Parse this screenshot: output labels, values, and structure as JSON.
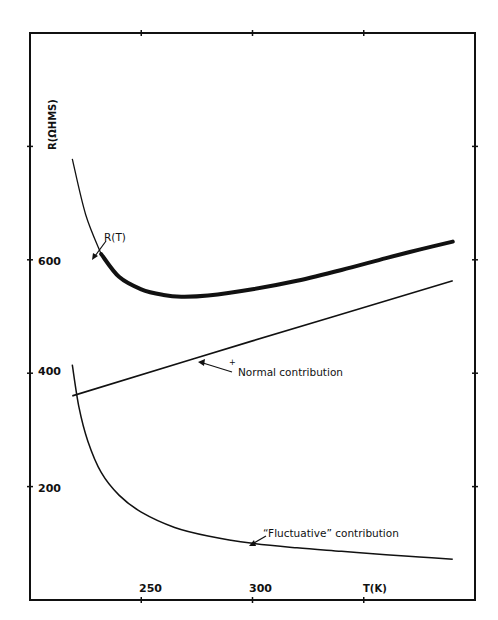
{
  "chart_data": {
    "type": "line",
    "title": "",
    "xlabel": "T(K)",
    "ylabel": "R(ΩHMS)",
    "xlim": [
      200,
      400
    ],
    "ylim": [
      0,
      1000
    ],
    "x_ticks": [
      200,
      250,
      300,
      350,
      400
    ],
    "x_tick_labels": [
      "",
      "250",
      "300",
      "",
      ""
    ],
    "y_ticks": [
      0,
      200,
      400,
      600,
      800,
      1000
    ],
    "y_tick_labels": [
      "",
      "200",
      "400",
      "600",
      "",
      ""
    ],
    "grid": false,
    "legend": "none (curves annotated with arrows)",
    "series": [
      {
        "name": "R(T)",
        "style": "thick line (data band) with thin extension at low T",
        "points": [
          [
            219,
            778
          ],
          [
            225,
            680
          ],
          [
            232,
            610
          ],
          [
            240,
            570
          ],
          [
            250,
            548
          ],
          [
            260,
            538
          ],
          [
            268,
            535
          ],
          [
            280,
            537
          ],
          [
            300,
            548
          ],
          [
            320,
            563
          ],
          [
            340,
            582
          ],
          [
            360,
            603
          ],
          [
            375,
            618
          ],
          [
            390,
            632
          ]
        ]
      },
      {
        "name": "Normal contribution",
        "style": "thin straight line",
        "points": [
          [
            219,
            360
          ],
          [
            300,
            457
          ],
          [
            390,
            563
          ]
        ]
      },
      {
        "name": "\"Fluctuative\" contribution",
        "style": "thin line",
        "points": [
          [
            219,
            415
          ],
          [
            222,
            340
          ],
          [
            226,
            280
          ],
          [
            232,
            225
          ],
          [
            240,
            185
          ],
          [
            250,
            155
          ],
          [
            265,
            128
          ],
          [
            280,
            113
          ],
          [
            300,
            100
          ],
          [
            320,
            92
          ],
          [
            340,
            86
          ],
          [
            360,
            80
          ],
          [
            375,
            76
          ],
          [
            390,
            72
          ]
        ]
      }
    ],
    "annotations": [
      {
        "text": "R(T)",
        "points_to": [
          224,
          610
        ]
      },
      {
        "text": "+ Normal contribution",
        "points_to": [
          279,
          432
        ]
      },
      {
        "text": "\" Fluctuative\" contribution",
        "points_to": [
          299,
          102
        ]
      }
    ]
  },
  "labels": {
    "ylabel": "R(ΩHMS)",
    "xlabel": "T(K)",
    "y200": "200",
    "y400": "400",
    "y600": "600",
    "x250": "250",
    "x300": "300",
    "ann_rt": "R(T)",
    "ann_normal_mark": "+",
    "ann_normal": "Normal contribution",
    "ann_fluct": "“Fluctuative” contribution"
  }
}
